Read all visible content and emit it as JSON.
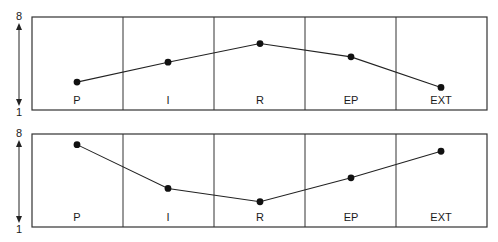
{
  "chart_data": [
    {
      "type": "line",
      "title": "",
      "categories": [
        "P",
        "I",
        "R",
        "EP",
        "EXT"
      ],
      "values": [
        3.1,
        4.6,
        6.0,
        5.0,
        2.7
      ],
      "ylim": [
        1,
        8
      ],
      "ytick_labels": [
        "1",
        "8"
      ],
      "xlabel": "",
      "ylabel": "",
      "grid": "vertical column dividers"
    },
    {
      "type": "line",
      "title": "",
      "categories": [
        "P",
        "I",
        "R",
        "EP",
        "EXT"
      ],
      "values": [
        7.2,
        3.9,
        2.9,
        4.7,
        6.7
      ],
      "ylim": [
        1,
        8
      ],
      "ytick_labels": [
        "1",
        "8"
      ],
      "xlabel": "",
      "ylabel": "",
      "grid": "vertical column dividers"
    }
  ],
  "panels": [
    {
      "axis": {
        "top_label": "8",
        "bottom_label": "1"
      },
      "columns": [
        "P",
        "I",
        "R",
        "EP",
        "EXT"
      ]
    },
    {
      "axis": {
        "top_label": "8",
        "bottom_label": "1"
      },
      "columns": [
        "P",
        "I",
        "R",
        "EP",
        "EXT"
      ]
    }
  ]
}
